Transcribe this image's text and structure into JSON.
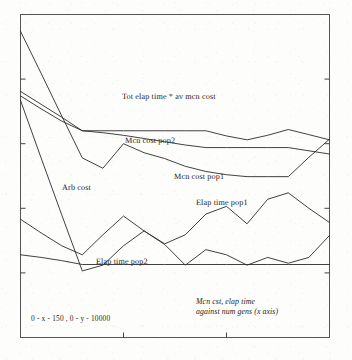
{
  "chart_data": {
    "type": "line",
    "title": "",
    "subtitle": "",
    "xlabel": "num gens (x axis)",
    "ylabel": "",
    "xlim": [
      0,
      150
    ],
    "ylim": [
      0,
      10000
    ],
    "grid": false,
    "legend_position": "inline-labels",
    "axis_range_note": "0 - x - 150 , 0 - y - 10000",
    "caption_line1": "Mcn cst, elap time",
    "caption_line2": "against num gens (x axis)",
    "x_tick_values": [
      50,
      100
    ],
    "y_tick_values": [
      2000,
      4000,
      6000,
      8000
    ],
    "x": [
      0,
      10,
      20,
      30,
      40,
      50,
      60,
      70,
      80,
      90,
      100,
      110,
      120,
      130,
      140,
      150
    ],
    "series": [
      {
        "name": "Tot elap time * av mcn cost",
        "label": "Tot elap time * av mcn cost",
        "label_x": 122,
        "label_y": 92,
        "values": [
          9480,
          8180,
          6860,
          5560,
          5240,
          6000,
          5720,
          5540,
          5300,
          5140,
          5040,
          4980,
          4980,
          4980,
          5580,
          6140
        ]
      },
      {
        "name": "Mcn cost pop2",
        "label": "Mcn cost pop2",
        "label_x": 125,
        "label_y": 136,
        "values": [
          7620,
          7220,
          6820,
          6400,
          6400,
          6400,
          6400,
          6400,
          6400,
          6400,
          6240,
          6120,
          6260,
          6440,
          6280,
          6120
        ]
      },
      {
        "name": "Mcn cost pop1",
        "label": "Mcn cost pop1",
        "label_x": 174,
        "label_y": 172,
        "values": [
          7480,
          7080,
          6700,
          6400,
          6340,
          6260,
          6160,
          6060,
          5960,
          5880,
          5880,
          5880,
          5880,
          5880,
          5780,
          5680
        ]
      },
      {
        "name": "Arb cost",
        "label": "Arb cost",
        "label_x": 62,
        "label_y": 183,
        "values": [
          7340,
          5560,
          3800,
          2060,
          2240,
          2840,
          3300,
          2880,
          2240,
          2720,
          2560,
          2240,
          2480,
          2300,
          2480,
          3160
        ]
      },
      {
        "name": "Elap time pop1",
        "label": "Elap time pop1",
        "label_x": 196,
        "label_y": 198,
        "values": [
          3660,
          3240,
          2840,
          2560,
          3180,
          3760,
          3300,
          2900,
          3180,
          3820,
          4060,
          3520,
          4280,
          4480,
          4000,
          3560
        ]
      },
      {
        "name": "Elap time pop2",
        "label": "Elap time pop2",
        "label_x": 96,
        "label_y": 257,
        "values": [
          2560,
          2480,
          2380,
          2260,
          2260,
          2260,
          2260,
          2260,
          2260,
          2260,
          2260,
          2260,
          2260,
          2260,
          2260,
          2260
        ]
      }
    ]
  }
}
